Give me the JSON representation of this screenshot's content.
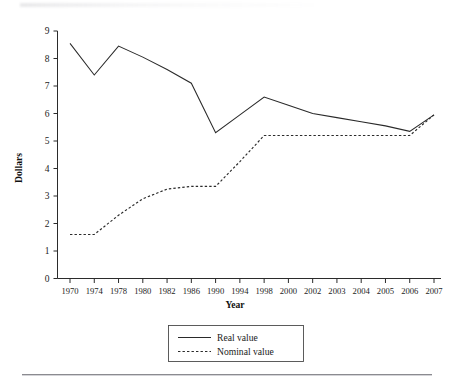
{
  "figure": {
    "y_axis_title": "Dollars",
    "x_axis_title": "Year"
  },
  "legend": {
    "items": [
      {
        "label": "Real value",
        "style": "solid"
      },
      {
        "label": "Nominal value",
        "style": "dashed"
      }
    ]
  },
  "chart_data": {
    "type": "line",
    "title": "",
    "xlabel": "Year",
    "ylabel": "Dollars",
    "grid": false,
    "legend_position": "bottom-center",
    "categories": [
      "1970",
      "1974",
      "1978",
      "1980",
      "1982",
      "1986",
      "1990",
      "1994",
      "1998",
      "2000",
      "2002",
      "2003",
      "2004",
      "2005",
      "2006",
      "2007"
    ],
    "x_tick_labels": [
      "1970",
      "1974",
      "1978",
      "1980",
      "1982",
      "1986",
      "1990",
      "1994",
      "1998",
      "2000",
      "2002",
      "2003",
      "2004",
      "2005",
      "2006",
      "2007"
    ],
    "y_tick_labels": [
      "0",
      "1",
      "2",
      "3",
      "4",
      "5",
      "6",
      "7",
      "8",
      "9"
    ],
    "ylim": [
      0,
      9
    ],
    "xlim_categories": 16,
    "series": [
      {
        "name": "Real value",
        "style": "solid",
        "values": [
          8.55,
          7.4,
          8.45,
          8.05,
          7.6,
          7.1,
          5.3,
          5.95,
          6.6,
          6.3,
          6.0,
          5.85,
          5.7,
          5.55,
          5.35,
          5.95
        ]
      },
      {
        "name": "Nominal value",
        "style": "dashed",
        "values": [
          1.6,
          1.6,
          2.3,
          2.9,
          3.25,
          3.35,
          3.35,
          4.25,
          5.2,
          5.2,
          5.2,
          5.2,
          5.2,
          5.2,
          5.2,
          5.95
        ]
      }
    ]
  }
}
